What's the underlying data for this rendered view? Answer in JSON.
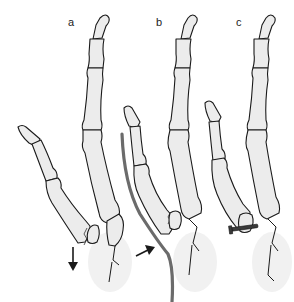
{
  "figure": {
    "panels": [
      {
        "id": "a",
        "label": "a",
        "annotation": "downward-arrow",
        "state": "displaced-fracture"
      },
      {
        "id": "b",
        "label": "b",
        "annotation": "push-arrow-and-wire",
        "state": "reduction-with-wire"
      },
      {
        "id": "c",
        "label": "c",
        "annotation": "screw",
        "state": "screw-fixation"
      }
    ],
    "colors": {
      "bone_fill": "#ececec",
      "outline": "#1a1a1a",
      "wire": "#6b6b6b",
      "screw": "#3a3a3a",
      "background": "#ffffff"
    }
  }
}
